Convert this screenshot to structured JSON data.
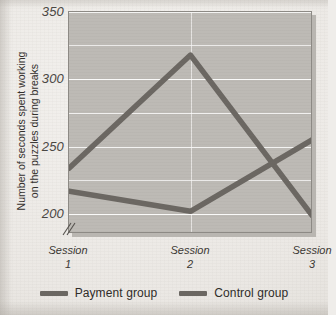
{
  "chart_data": {
    "type": "line",
    "title": "",
    "xlabel": "",
    "ylabel": "Number of seconds spent working on the puzzles during breaks",
    "ylabel_line1": "Number of seconds spent working",
    "ylabel_line2": "on the puzzles during breaks",
    "categories": [
      "Session 1",
      "Session 2",
      "Session 3"
    ],
    "tick_word": "Session",
    "tick_numbers": [
      "1",
      "2",
      "3"
    ],
    "ylim": [
      185,
      350
    ],
    "yticks": [
      350,
      300,
      250,
      200
    ],
    "ytick_labels": [
      "350",
      "300",
      "250",
      "200"
    ],
    "minor_gridlines": [
      325,
      275,
      225
    ],
    "grid": true,
    "axis_break": true,
    "legend_position": "bottom",
    "series": [
      {
        "name": "Payment group",
        "color": "#6b6762",
        "values": [
          234,
          318,
          199
        ]
      },
      {
        "name": "Control group",
        "color": "#6b6762",
        "values": [
          217,
          202,
          255
        ]
      }
    ]
  },
  "colors": {
    "plot_background": "#bdbab5",
    "page_background": "#efedea",
    "line": "#6b6762",
    "gridline": "#ffffff",
    "text": "#33302d"
  },
  "legend": {
    "items": [
      {
        "label": "Payment group"
      },
      {
        "label": "Control group"
      }
    ]
  }
}
